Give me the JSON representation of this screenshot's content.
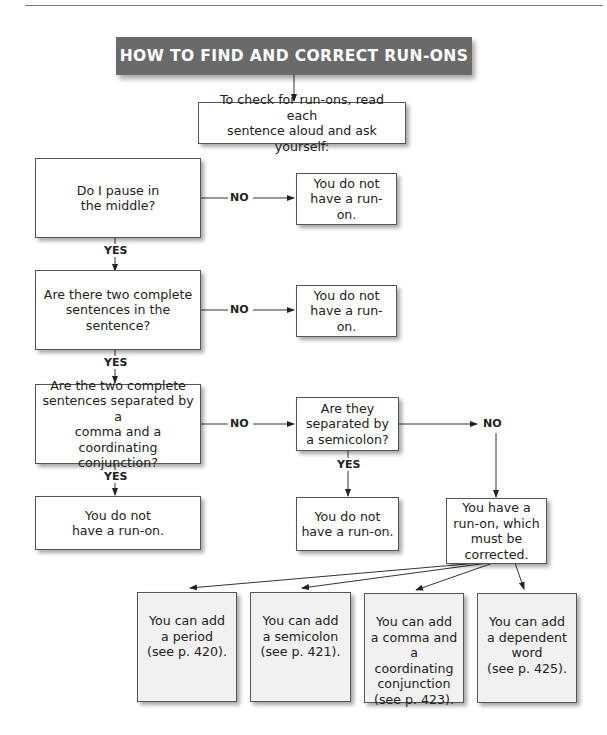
{
  "title": "HOW TO FIND AND CORRECT RUN-ONS",
  "intro": "To check for run-ons, read each\nsentence aloud and ask yourself:",
  "questions": [
    {
      "text": "Do I pause in\nthe middle?",
      "no_result": "You do not\nhave a run-on."
    },
    {
      "text": "Are there two complete\nsentences in the sentence?",
      "no_result": "You do not\nhave a run-on."
    },
    {
      "text": "Are the two complete\nsentences separated by a\ncomma and a coordinating\nconjunction?",
      "yes_result": "You do not\nhave a run-on."
    }
  ],
  "semicolon_question": {
    "text": "Are they\nseparated by\na semicolon?",
    "yes_result": "You do not\nhave a run-on."
  },
  "runon_result": "You have a\nrun-on, which\nmust be corrected.",
  "labels": {
    "yes": "YES",
    "no": "NO"
  },
  "fixes": [
    "You can add\na period\n(see p. 420).",
    "You can add\na semicolon\n(see p. 421).",
    "You can add\na comma and\na coordinating\nconjunction\n(see p. 423).",
    "You can add\na dependent\nword\n(see p. 425)."
  ]
}
